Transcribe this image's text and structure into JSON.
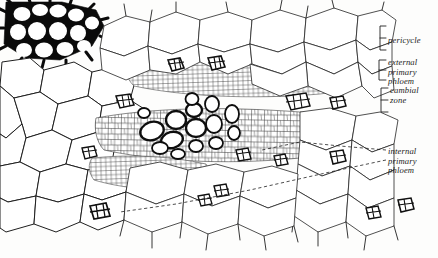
{
  "figure": {
    "kind": "botanical-line-drawing",
    "background_color": "#fdfdfc",
    "ink_color": "#1a1a1a"
  },
  "labels": {
    "pericycle": "pericycle",
    "external_primary_phloem": "external\nprimary\nphloem",
    "external_primary_phloem_lines": [
      "external",
      "primary",
      "phloem"
    ],
    "cambial_zone": "cambial\nzone",
    "cambial_zone_lines": [
      "cambial",
      "zone"
    ],
    "internal_primary_phloem": "internal\nprimary\nphloem",
    "internal_primary_phloem_lines": [
      "internal",
      "primary",
      "phloem"
    ]
  },
  "leaders": {
    "pericycle_style": "bracket",
    "external_primary_phloem_style": "bracket",
    "cambial_zone_style": "bracket",
    "internal_primary_phloem_style": "dashed-double-line"
  },
  "tissue_zones": [
    {
      "name": "sclerenchyma-fibers",
      "description": "heavy black thick-walled cells, upper left corner"
    },
    {
      "name": "cortical-parenchyma",
      "description": "large rounded thin-walled cells, left and lower region"
    },
    {
      "name": "pericycle",
      "description": "band of cells at outer upper right"
    },
    {
      "name": "external-primary-phloem",
      "description": "small dark sieve-tube clusters in upper band"
    },
    {
      "name": "cambial-zone",
      "description": "fine small-celled band across middle"
    },
    {
      "name": "internal-primary-phloem",
      "description": "cluster of dark thick-walled cells in center"
    }
  ]
}
